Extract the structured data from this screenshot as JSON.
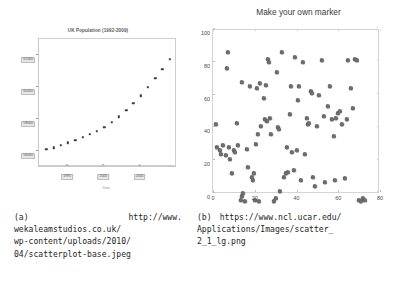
{
  "figure_a": {
    "label": "(a)",
    "source_url": "http://www.wekaleamstudios.co.uk/wp-content/uploads/2010/04/scatterplot-base.jpeg",
    "caption_lines": [
      "http://www.",
      "wekaleamstudios.co.uk/",
      "wp-content/uploads/2010/",
      "04/scatterplot-base.jpeg"
    ],
    "chart_data": {
      "type": "scatter",
      "title": "UK Population (1992-2009)",
      "xlabel": "Year",
      "ylabel": "Total Population (Thousands)",
      "xlim": [
        1991,
        2010
      ],
      "ylim": [
        55000,
        63000
      ],
      "xticks": [
        1995,
        2000,
        2005
      ],
      "yticks": [
        56000,
        58000,
        60000,
        62000
      ],
      "grid": false,
      "legend": "none",
      "x": [
        1992,
        1993,
        1994,
        1995,
        1996,
        1997,
        1998,
        1999,
        2000,
        2001,
        2002,
        2003,
        2004,
        2005,
        2006,
        2007,
        2008,
        2009
      ],
      "y": [
        55985,
        56085,
        56235,
        56400,
        56565,
        56735,
        56925,
        57130,
        57380,
        57660,
        58020,
        58415,
        58845,
        59325,
        59850,
        60410,
        61000,
        61595
      ],
      "series_name": "UK Population"
    }
  },
  "figure_b": {
    "label": "(b)",
    "source_url": "https://www.ncl.ucar.edu/Applications/Images/scatter_2_1_lg.png",
    "caption_lines": [
      "https://www.ncl.ucar.edu/",
      "Applications/Images/scatter_",
      "2_1_lg.png"
    ],
    "chart_data": {
      "type": "scatter",
      "title": "Make your own marker",
      "xlabel": "",
      "ylabel": "",
      "xlim": [
        0,
        80
      ],
      "ylim": [
        0,
        100
      ],
      "xticks": [
        0,
        20,
        40,
        60,
        80
      ],
      "yticks": [
        0,
        20,
        40,
        60,
        80,
        100
      ],
      "grid": false,
      "legend": "none",
      "marker": "custom-blob",
      "points": [
        [
          1.5,
          47
        ],
        [
          2.0,
          33
        ],
        [
          3.5,
          31
        ],
        [
          4.0,
          29
        ],
        [
          5.0,
          34
        ],
        [
          6.0,
          28
        ],
        [
          6.5,
          81
        ],
        [
          7.0,
          91
        ],
        [
          7.5,
          33
        ],
        [
          8.0,
          26
        ],
        [
          9.0,
          17
        ],
        [
          10.0,
          31
        ],
        [
          10.5,
          30
        ],
        [
          11.5,
          48
        ],
        [
          12.0,
          34
        ],
        [
          13.5,
          1
        ],
        [
          14.0,
          3
        ],
        [
          14.5,
          5
        ],
        [
          14.0,
          73
        ],
        [
          15.5,
          0
        ],
        [
          16.5,
          32
        ],
        [
          17.0,
          21
        ],
        [
          17.5,
          70
        ],
        [
          18.5,
          15
        ],
        [
          19.0,
          13
        ],
        [
          19.5,
          17
        ],
        [
          20.0,
          1
        ],
        [
          20.5,
          35
        ],
        [
          21.0,
          69
        ],
        [
          21.5,
          41
        ],
        [
          22.0,
          0
        ],
        [
          22.5,
          72
        ],
        [
          23.0,
          46
        ],
        [
          24.5,
          63
        ],
        [
          25.0,
          50
        ],
        [
          25.5,
          71
        ],
        [
          26.0,
          49
        ],
        [
          26.5,
          87
        ],
        [
          27.0,
          85
        ],
        [
          27.5,
          51
        ],
        [
          28.0,
          41
        ],
        [
          29.0,
          0
        ],
        [
          30.0,
          2
        ],
        [
          30.5,
          79
        ],
        [
          31.0,
          45
        ],
        [
          31.5,
          44
        ],
        [
          32.0,
          6
        ],
        [
          33.0,
          91
        ],
        [
          34.0,
          15
        ],
        [
          35.0,
          17
        ],
        [
          35.5,
          33
        ],
        [
          36.0,
          18
        ],
        [
          37.0,
          53
        ],
        [
          37.5,
          70
        ],
        [
          38.0,
          30
        ],
        [
          39.0,
          19
        ],
        [
          39.5,
          88
        ],
        [
          40.0,
          31
        ],
        [
          40.5,
          62
        ],
        [
          41.0,
          70
        ],
        [
          42.0,
          13
        ],
        [
          43.0,
          85
        ],
        [
          44.0,
          29
        ],
        [
          45.0,
          51
        ],
        [
          45.5,
          47
        ],
        [
          46.0,
          48
        ],
        [
          47.0,
          67
        ],
        [
          47.5,
          66
        ],
        [
          48.0,
          15
        ],
        [
          49.0,
          9
        ],
        [
          50.0,
          46
        ],
        [
          51.0,
          65
        ],
        [
          52.0,
          86
        ],
        [
          53.0,
          52
        ],
        [
          53.5,
          12
        ],
        [
          55.0,
          58
        ],
        [
          56.0,
          70
        ],
        [
          57.0,
          50
        ],
        [
          58.0,
          40
        ],
        [
          58.5,
          13
        ],
        [
          59.0,
          51
        ],
        [
          60.0,
          54
        ],
        [
          61.0,
          55
        ],
        [
          62.0,
          47
        ],
        [
          63.0,
          14
        ],
        [
          64.0,
          50
        ],
        [
          64.5,
          86
        ],
        [
          66.0,
          69
        ],
        [
          67.0,
          57
        ],
        [
          68.0,
          87
        ],
        [
          69.0,
          86
        ],
        [
          70.0,
          1
        ],
        [
          71.0,
          0
        ],
        [
          72.0,
          2
        ],
        [
          73.0,
          1
        ]
      ]
    }
  }
}
